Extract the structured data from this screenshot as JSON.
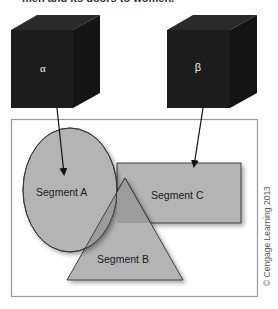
{
  "caption": "men and its doors to women.",
  "cubes": [
    {
      "id": "alpha",
      "label": "α"
    },
    {
      "id": "beta",
      "label": "β"
    }
  ],
  "segments": [
    {
      "id": "A",
      "label": "Segment A",
      "shape": "ellipse"
    },
    {
      "id": "B",
      "label": "Segment B",
      "shape": "triangle"
    },
    {
      "id": "C",
      "label": "Segment C",
      "shape": "rectangle"
    }
  ],
  "arrows": [
    {
      "from": "alpha",
      "to": "Segment A"
    },
    {
      "from": "beta",
      "to": "Segment C"
    }
  ],
  "credit": "© Cengage Learning 2013",
  "colors": {
    "cube": "#1c1c1c",
    "shape_fill": "#b4b4b4",
    "overlap_fill": "#9c9c9c",
    "frame": "#9a9a9a"
  }
}
